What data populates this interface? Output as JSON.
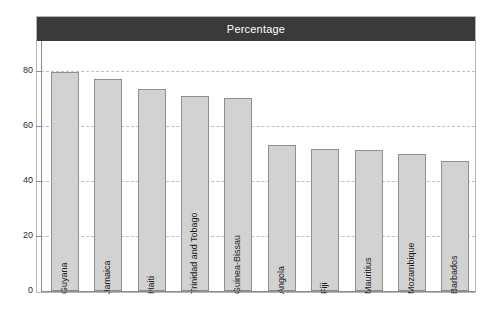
{
  "chart": {
    "title": "Percentage"
  },
  "chart_data": {
    "type": "bar",
    "title": "Percentage",
    "xlabel": "",
    "ylabel": "",
    "ylim": [
      0,
      88
    ],
    "yticks": [
      0,
      20,
      40,
      60,
      80
    ],
    "ytick_labels": [
      "0",
      "20",
      "40",
      "60",
      "80"
    ],
    "grid": true,
    "legend": false,
    "orientation": "vertical",
    "categories": [
      "Guyana",
      "Jamaica",
      "Haiti",
      "Trinidad and Tobago",
      "Guinea-Bissau",
      "Angola",
      "Fiji",
      "Mauritius",
      "Mozambique",
      "Barbados"
    ],
    "values": [
      79.6,
      77.1,
      73.5,
      70.9,
      70.2,
      53.1,
      51.6,
      51.3,
      49.8,
      47.3
    ],
    "colors": {
      "bar_fill": "#d2d2d2",
      "bar_border": "#8f8f8f",
      "title_bar": "#3a3a3a",
      "title_text": "#ffffff",
      "gridline": "#a9c4d8",
      "axis": "#8d8d8d",
      "frame": "#b6b6b6",
      "background": "#ffffff"
    }
  }
}
